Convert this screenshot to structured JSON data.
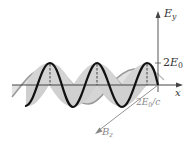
{
  "diagram": {
    "type": "electromagnetic-wave",
    "labels": {
      "ey_axis": {
        "main": "E",
        "sub": "y"
      },
      "x_axis": "x",
      "bz_axis": {
        "main": "B",
        "sub": "z"
      },
      "e_amplitude": {
        "prefix": "2",
        "main": "E",
        "sub": "0"
      },
      "b_amplitude": {
        "prefix": "2",
        "main": "E",
        "sub": "0",
        "suffix": "/c"
      }
    },
    "colors": {
      "e_wave": "#111111",
      "b_wave": "#9a9a9a",
      "fill": "#d9d9d9",
      "axis": "#444444",
      "bz_axis": "#888888"
    }
  }
}
